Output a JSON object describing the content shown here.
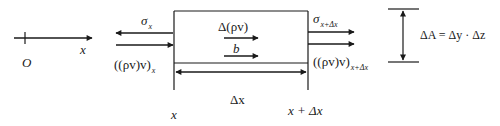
{
  "diagram": {
    "type": "control-volume-momentum-balance",
    "axis": {
      "origin_label": "O",
      "axis_label": "x"
    },
    "left_face": {
      "stress_label": "σ",
      "stress_subscript": "x",
      "flux_label": "((ρv)v)",
      "flux_subscript": "x",
      "position_label": "x"
    },
    "right_face": {
      "stress_label": "σ",
      "stress_subscript": "x+Δx",
      "flux_label": "((ρv)v)",
      "flux_subscript": "x+Δx",
      "position_label": "x + Δx"
    },
    "interior": {
      "accumulation_label": "Δ(ρv)",
      "body_force_label": "b"
    },
    "width_label": "Δx",
    "area": {
      "label": "ΔA = Δy · Δz"
    }
  },
  "colors": {
    "line": "#1a1a1a",
    "background": "#ffffff"
  }
}
